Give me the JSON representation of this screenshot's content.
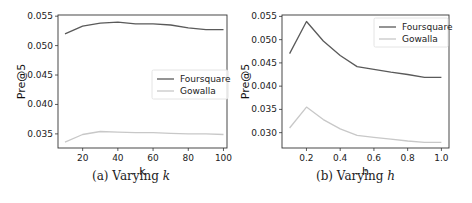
{
  "chart_data": [
    {
      "type": "line",
      "title": "",
      "caption": "(a) Varying k",
      "caption_prefix": "(a) Varying ",
      "caption_var": "k",
      "xlabel": "k",
      "ylabel": "Pre@5",
      "x": [
        10,
        20,
        30,
        40,
        50,
        60,
        70,
        80,
        90,
        100
      ],
      "xticks": [
        20,
        40,
        60,
        80,
        100
      ],
      "xtick_labels": [
        "20",
        "40",
        "60",
        "80",
        "100"
      ],
      "yticks": [
        0.035,
        0.04,
        0.045,
        0.05,
        0.055
      ],
      "ytick_labels": [
        "0.035",
        "0.040",
        "0.045",
        "0.050",
        "0.055"
      ],
      "xlim": [
        6,
        102
      ],
      "ylim": [
        0.0326,
        0.0552
      ],
      "grid": false,
      "legend_position": "center right",
      "series": [
        {
          "name": "Foursquare",
          "color": "#5a5a5a",
          "values": [
            0.052,
            0.0533,
            0.0538,
            0.054,
            0.0537,
            0.0537,
            0.0535,
            0.053,
            0.0527,
            0.0527
          ]
        },
        {
          "name": "Gowalla",
          "color": "#c8c8c8",
          "values": [
            0.0336,
            0.0349,
            0.0354,
            0.0353,
            0.0352,
            0.0352,
            0.0351,
            0.035,
            0.035,
            0.0349
          ]
        }
      ]
    },
    {
      "type": "line",
      "title": "",
      "caption": "(b) Varying h",
      "caption_prefix": "(b) Varying ",
      "caption_var": "h",
      "xlabel": "h",
      "ylabel": "Pre@5",
      "x": [
        0.1,
        0.2,
        0.3,
        0.4,
        0.5,
        0.6,
        0.7,
        0.8,
        0.9,
        1.0
      ],
      "xticks": [
        0.2,
        0.4,
        0.6,
        0.8,
        1.0
      ],
      "xtick_labels": [
        "0.2",
        "0.4",
        "0.6",
        "0.8",
        "1.0"
      ],
      "yticks": [
        0.03,
        0.035,
        0.04,
        0.045,
        0.05,
        0.055
      ],
      "ytick_labels": [
        "0.030",
        "0.035",
        "0.040",
        "0.045",
        "0.050",
        "0.055"
      ],
      "xlim": [
        0.055,
        1.045
      ],
      "ylim": [
        0.0267,
        0.0553
      ],
      "grid": false,
      "legend_position": "upper right",
      "series": [
        {
          "name": "Foursquare",
          "color": "#5a5a5a",
          "values": [
            0.047,
            0.0539,
            0.0497,
            0.0466,
            0.0442,
            0.0436,
            0.043,
            0.0425,
            0.0419,
            0.0419
          ]
        },
        {
          "name": "Gowalla",
          "color": "#c8c8c8",
          "values": [
            0.031,
            0.0355,
            0.0328,
            0.0308,
            0.0294,
            0.029,
            0.0286,
            0.0282,
            0.0279,
            0.0279
          ]
        }
      ]
    }
  ],
  "layout": {
    "panels": [
      {
        "left": 58,
        "top": 15,
        "right": 227,
        "bottom": 148,
        "legend": {
          "x": 152,
          "y": 70,
          "w": 76,
          "h": 29
        },
        "caption_x": 92,
        "caption_y": 181
      },
      {
        "left": 282,
        "top": 15,
        "right": 449,
        "bottom": 148,
        "legend": {
          "x": 374,
          "y": 18,
          "w": 74,
          "h": 29
        },
        "caption_x": 316,
        "caption_y": 181
      }
    ]
  }
}
